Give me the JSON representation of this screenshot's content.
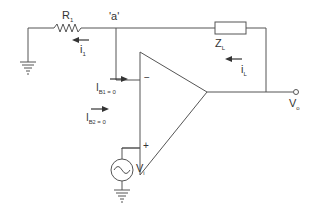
{
  "diagram": {
    "type": "circuit",
    "colors": {
      "wire": "#555555",
      "text": "#333333",
      "background": "#ffffff"
    },
    "labels": {
      "r1": {
        "main": "R",
        "sub": "1"
      },
      "node_a": "'a'",
      "i1": {
        "main": "i",
        "sub": "1"
      },
      "zl": {
        "main": "Z",
        "sub": "L"
      },
      "il": {
        "main": "i",
        "sub": "L"
      },
      "ib1": {
        "main": "I",
        "sub": "B",
        "subsub": "1",
        "eq": " = 0"
      },
      "ib2": {
        "main": "I",
        "sub": "B",
        "subsub": "2",
        "eq": " = 0"
      },
      "vi": {
        "main": "V",
        "sub": "i"
      },
      "vo": {
        "main": "V",
        "sub": "o"
      },
      "minus": "−",
      "plus": "+"
    },
    "components": [
      {
        "id": "R1",
        "kind": "resistor",
        "label": "R1"
      },
      {
        "id": "ZL",
        "kind": "impedance",
        "label": "ZL"
      },
      {
        "id": "opamp",
        "kind": "op-amp",
        "inputs": [
          "−",
          "+"
        ]
      },
      {
        "id": "Vi",
        "kind": "ac-source",
        "label": "Vi"
      },
      {
        "id": "gnd1",
        "kind": "ground"
      },
      {
        "id": "gnd2",
        "kind": "ground"
      }
    ],
    "currents": [
      "i1",
      "iL",
      "IB1 = 0",
      "IB2 = 0"
    ],
    "nodes": [
      "'a'",
      "Vo"
    ]
  }
}
